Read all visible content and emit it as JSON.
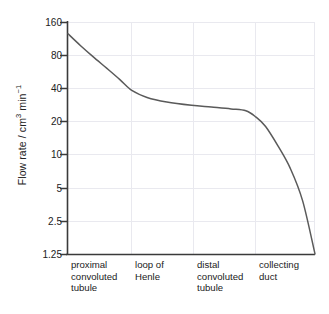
{
  "axis": {
    "y_title_main": "Flow rate / cm",
    "y_title_sup1": "3",
    "y_title_mid": " min",
    "y_title_sup2": "−1",
    "y_title_full": "Flow rate / cm3 min-1",
    "y_ticks": [
      "160",
      "80",
      "40",
      "20",
      "10",
      "5",
      "2.5",
      "1.25"
    ],
    "x_categories": [
      "proximal convoluted tubule",
      "loop of Henle",
      "distal convoluted tubule",
      "collecting duct"
    ]
  },
  "colors": {
    "curve": "#5a5a5a",
    "axis": "#3a3a3a",
    "grid": "#e9e9ef",
    "text": "#222222",
    "background": "#ffffff"
  },
  "chart_data": {
    "type": "line",
    "title": "",
    "xlabel": "",
    "ylabel": "Flow rate / cm3 min-1",
    "yscale": "log2",
    "ylim": [
      1.25,
      160
    ],
    "yticks": [
      160,
      80,
      40,
      20,
      10,
      5,
      2.5,
      1.25
    ],
    "ytick_labels": [
      "160",
      "80",
      "40",
      "20",
      "10",
      "5",
      "2.5",
      "1.25"
    ],
    "grid": true,
    "legend": "none",
    "categories": [
      "proximal convoluted tubule",
      "loop of Henle",
      "distal convoluted tubule",
      "collecting duct"
    ],
    "category_boundaries_fraction": [
      0.0,
      0.258,
      0.508,
      0.758,
      1.0
    ],
    "series": [
      {
        "name": "filtrate flow rate",
        "x": [
          0.0,
          0.05,
          0.1,
          0.16,
          0.21,
          0.26,
          0.32,
          0.4,
          0.5,
          0.58,
          0.66,
          0.72,
          0.76,
          0.8,
          0.85,
          0.9,
          0.95,
          1.0
        ],
        "values": [
          125,
          98,
          78,
          60,
          48,
          38,
          33,
          30,
          28,
          27,
          26,
          25,
          22,
          18,
          12,
          7.5,
          3.8,
          1.25
        ]
      }
    ],
    "annotations": [
      "Flow rate falls steeply through the proximal convoluted tubule",
      "Flow rate plateaus near 26 cm3 min-1 across loop of Henle and distal convoluted tubule",
      "Flow rate falls sharply to 1.25 cm3 min-1 in the collecting duct"
    ]
  }
}
